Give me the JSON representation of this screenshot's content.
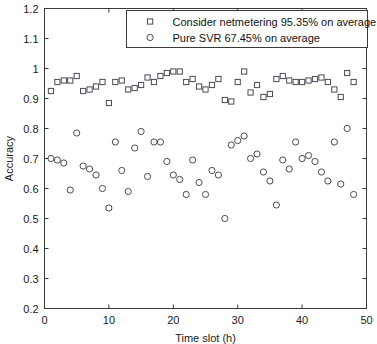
{
  "chart_data": {
    "type": "scatter",
    "title": "",
    "xlabel": "Time slot (h)",
    "ylabel": "Accuracy",
    "xlim": [
      0,
      50
    ],
    "ylim": [
      0.2,
      1.2
    ],
    "xticks": [
      0,
      10,
      20,
      30,
      40,
      50
    ],
    "xtick_labels": [
      "0",
      "10",
      "20",
      "30",
      "40",
      "50"
    ],
    "yticks": [
      0.2,
      0.3,
      0.4,
      0.5,
      0.6,
      0.7,
      0.8,
      0.9,
      1.0,
      1.1,
      1.2
    ],
    "ytick_labels": [
      "0.2",
      "0.3",
      "0.4",
      "0.5",
      "0.6",
      "0.7",
      "0.8",
      "0.9",
      "1",
      "1.1",
      "1.2"
    ],
    "grid": false,
    "legend_position": "upper right",
    "legend": [
      {
        "marker": "square",
        "label": "Consider netmetering 95.35% on average"
      },
      {
        "marker": "circle",
        "label": "Pure SVR 67.45% on average"
      }
    ],
    "series": [
      {
        "name": "Consider netmetering 95.35% on average",
        "marker": "square",
        "color": "#4a4a57",
        "mean": 0.9535,
        "x": [
          1,
          2,
          3,
          4,
          5,
          6,
          7,
          8,
          9,
          10,
          11,
          12,
          13,
          14,
          15,
          16,
          17,
          18,
          19,
          20,
          21,
          22,
          23,
          24,
          25,
          26,
          27,
          28,
          29,
          30,
          31,
          32,
          33,
          34,
          35,
          36,
          37,
          38,
          39,
          40,
          41,
          42,
          43,
          44,
          45,
          46,
          47,
          48
        ],
        "values": [
          0.925,
          0.955,
          0.96,
          0.96,
          0.975,
          0.925,
          0.93,
          0.94,
          0.955,
          0.885,
          0.955,
          0.96,
          0.93,
          0.935,
          0.945,
          0.97,
          0.955,
          0.975,
          0.985,
          0.99,
          0.99,
          0.955,
          0.965,
          0.94,
          0.93,
          0.945,
          0.965,
          0.895,
          0.89,
          0.955,
          0.99,
          0.92,
          0.945,
          0.905,
          0.915,
          0.965,
          0.975,
          0.96,
          0.955,
          0.955,
          0.96,
          0.965,
          0.97,
          0.955,
          0.93,
          0.905,
          0.985,
          0.955
        ]
      },
      {
        "name": "Pure SVR 67.45% on average",
        "marker": "circle",
        "color": "#4a4a57",
        "mean": 0.6745,
        "x": [
          1,
          2,
          3,
          4,
          5,
          6,
          7,
          8,
          9,
          10,
          11,
          12,
          13,
          14,
          15,
          16,
          17,
          18,
          19,
          20,
          21,
          22,
          23,
          24,
          25,
          26,
          27,
          28,
          29,
          30,
          31,
          32,
          33,
          34,
          35,
          36,
          37,
          38,
          39,
          40,
          41,
          42,
          43,
          44,
          45,
          46,
          47,
          48
        ],
        "values": [
          0.7,
          0.695,
          0.685,
          0.595,
          0.785,
          0.675,
          0.665,
          0.645,
          0.6,
          0.535,
          0.755,
          0.66,
          0.59,
          0.735,
          0.79,
          0.64,
          0.755,
          0.755,
          0.69,
          0.645,
          0.63,
          0.58,
          0.695,
          0.62,
          0.58,
          0.66,
          0.645,
          0.5,
          0.745,
          0.76,
          0.775,
          0.7,
          0.715,
          0.655,
          0.625,
          0.545,
          0.695,
          0.665,
          0.755,
          0.7,
          0.71,
          0.69,
          0.655,
          0.625,
          0.755,
          0.615,
          0.8,
          0.58
        ]
      }
    ]
  }
}
